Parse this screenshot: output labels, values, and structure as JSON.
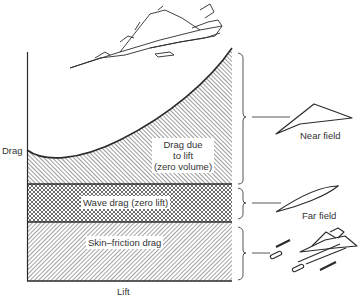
{
  "axes": {
    "y_label": "Drag",
    "x_label": "Lift"
  },
  "regions": [
    {
      "id": "lift-drag",
      "label_lines": [
        "Drag due",
        "to lift",
        "(zero volume)"
      ],
      "pattern": "diagonal-hatch-dense"
    },
    {
      "id": "wave-drag",
      "label": "Wave drag (zero lift)",
      "pattern": "crosshatch"
    },
    {
      "id": "skin-friction",
      "label": "Skin–friction drag",
      "pattern": "diagonal-hatch-light"
    }
  ],
  "annotations": {
    "near_field": "Near field",
    "far_field": "Far field"
  },
  "icons": [
    "aircraft-icon",
    "delta-wing-planform-icon",
    "slender-body-icon",
    "aircraft-exploded-icon"
  ],
  "colors": {
    "ink": "#2a2a2a",
    "background": "#ffffff"
  }
}
